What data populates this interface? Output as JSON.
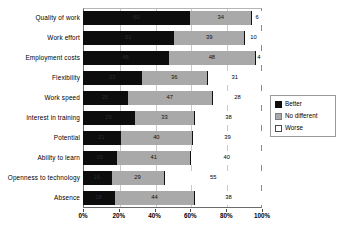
{
  "chart_data": {
    "type": "bar",
    "orientation": "horizontal",
    "stacked": true,
    "stack_total": 100,
    "title": "",
    "subtitle": "",
    "xlabel": "",
    "ylabel": "",
    "xlim": [
      0,
      100
    ],
    "xtick_labels": [
      "0%",
      "20%",
      "40%",
      "60%",
      "80%",
      "100%"
    ],
    "xtick_values": [
      0,
      20,
      40,
      60,
      80,
      100
    ],
    "grid": true,
    "grid_axis": "x",
    "legend_position": "right",
    "categories": [
      "Quality of work",
      "Work effort",
      "Employment costs",
      "Flexibility",
      "Work speed",
      "Interest in training",
      "Potential",
      "Ability to learn",
      "Openness to technology",
      "Absence"
    ],
    "series": [
      {
        "name": "Better",
        "color": "#0d0d0d",
        "values": [
          60,
          51,
          48,
          33,
          25,
          29,
          21,
          19,
          16,
          18
        ]
      },
      {
        "name": "No different",
        "color": "#a9a9a9",
        "values": [
          34,
          39,
          48,
          36,
          47,
          33,
          40,
          41,
          29,
          44
        ]
      },
      {
        "name": "Worse",
        "color": "#ffffff",
        "values": [
          6,
          10,
          4,
          31,
          28,
          38,
          39,
          40,
          55,
          38
        ]
      }
    ]
  },
  "legend": {
    "items": [
      {
        "label": "Better",
        "swatch": "sw-better"
      },
      {
        "label": "No different",
        "swatch": "sw-nodiff"
      },
      {
        "label": "Worse",
        "swatch": "sw-worse"
      }
    ]
  }
}
